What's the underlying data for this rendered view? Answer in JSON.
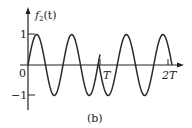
{
  "figure": {
    "caption": "(b)"
  },
  "chart_data": {
    "type": "line",
    "title": "",
    "ylabel": "f2(t)",
    "ylabel_main": "f",
    "ylabel_sub": "2",
    "ylabel_arg": "(t)",
    "xlabel": "",
    "x_ticks": [
      {
        "label": "0",
        "value": 0
      },
      {
        "label": "T",
        "value": 1
      },
      {
        "label": "2T",
        "value": 2
      }
    ],
    "y_ticks": [
      {
        "label": "1",
        "value": 1
      },
      {
        "label": "-1",
        "value": -1
      }
    ],
    "ylim": [
      -1,
      1
    ],
    "xlim": [
      0,
      2
    ],
    "grid": false,
    "series": [
      {
        "name": "f2(t), 0 ≤ t < T",
        "description": "sinusoid starting at 0 rising, about 2 full cycles, ends slightly above zero at T",
        "x": [
          0,
          0.14,
          0.25,
          0.37,
          0.49,
          0.62,
          0.73,
          0.85,
          0.96,
          1.0
        ],
        "y": [
          0,
          1,
          0,
          -1,
          0,
          1,
          0,
          -1,
          0,
          0.35
        ]
      },
      {
        "name": "f2(t), T ≤ t ≤ 2T",
        "description": "sinusoid restarting at 0 at T, falling first (phase jump at T), about 2 cycles",
        "x": [
          1.0,
          1.12,
          1.24,
          1.37,
          1.49,
          1.61,
          1.74,
          1.86,
          1.98,
          2.0
        ],
        "y": [
          0,
          -1,
          0,
          1,
          0,
          -1,
          0,
          1,
          0,
          -0.2
        ]
      }
    ],
    "annotations": [
      "phase discontinuity at t = T"
    ]
  },
  "colors": {
    "curve": "#2a2a2a",
    "axis": "#222222",
    "background": "#ffffff"
  }
}
